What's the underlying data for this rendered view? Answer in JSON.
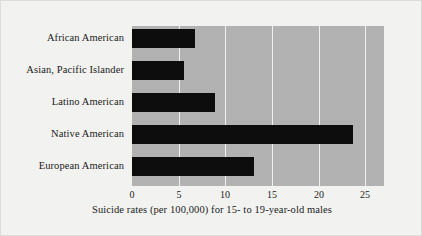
{
  "chart_data": {
    "type": "bar",
    "orientation": "horizontal",
    "title": "",
    "subtitle": "",
    "xlabel": "Suicide rates (per 100,000) for 15- to 19-year-old males",
    "ylabel": "",
    "categories": [
      "African American",
      "Asian, Pacific Islander",
      "Latino American",
      "Native American",
      "European American"
    ],
    "values": [
      6.8,
      5.6,
      8.9,
      23.7,
      13.1
    ],
    "xlim": [
      0,
      27
    ],
    "xticks": [
      0,
      5,
      10,
      15,
      20,
      25
    ],
    "xtick_labels": [
      "0",
      "5",
      "10",
      "15",
      "20",
      "25"
    ],
    "grid": "vertical-white-gridlines",
    "legend": "none",
    "colors": {
      "bar": "#0d0d0d",
      "plot_background": "#b2b2b2",
      "gridline": "#f0f0ee",
      "page_background": "#f2f2f0",
      "text": "#1b1b1b"
    }
  }
}
